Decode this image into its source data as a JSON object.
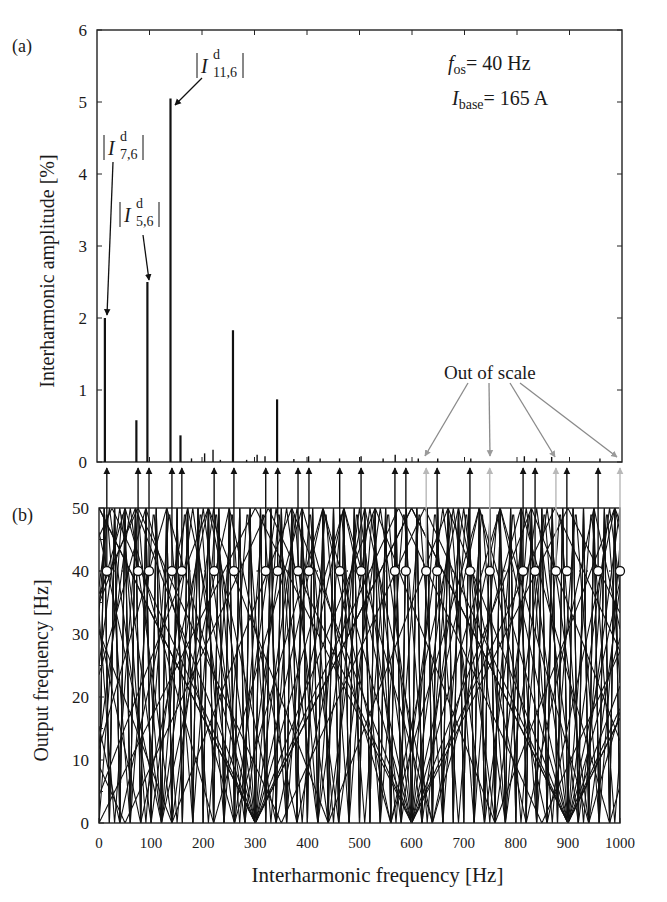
{
  "chart_data": [
    {
      "panel": "(a)",
      "type": "bar",
      "title": "",
      "xlabel": "",
      "ylabel": "Interharmonic amplitude [%]",
      "xlim": [
        0,
        1000
      ],
      "ylim": [
        0,
        6
      ],
      "yticks": [
        "0",
        "1",
        "2",
        "3",
        "4",
        "5",
        "6"
      ],
      "annotations": {
        "fos": "f",
        "fos_sub": "os",
        "fos_val": "= 40 Hz",
        "ibase": "I",
        "ibase_sub": "base",
        "ibase_val": "= 165 A",
        "out_of_scale": "Out of scale",
        "i11": {
          "I": "I",
          "sup": "d",
          "sub": "11,6"
        },
        "i7": {
          "I": "I",
          "sup": "d",
          "sub": "7,6"
        },
        "i5": {
          "I": "I",
          "sup": "d",
          "sub": "5,6"
        }
      },
      "x": [
        15,
        75,
        96,
        140,
        159,
        180,
        205,
        221,
        235,
        259,
        285,
        305,
        320,
        343,
        375,
        403,
        425,
        462,
        503,
        545,
        568,
        589,
        612,
        649,
        712,
        750,
        814,
        837,
        866,
        898,
        958
      ],
      "values": [
        2.0,
        0.58,
        2.5,
        5.05,
        0.37,
        0.05,
        0.12,
        0.17,
        0.03,
        1.83,
        0.03,
        0.1,
        0.08,
        0.87,
        0.04,
        0.08,
        0.05,
        0.05,
        0.08,
        0.05,
        0.1,
        0.05,
        0.05,
        0.05,
        0.05,
        0.0,
        0.08,
        0.05,
        0.07,
        0.0,
        0.05
      ],
      "legend": []
    },
    {
      "panel": "(b)",
      "type": "line",
      "title": "",
      "xlabel": "Interharmonic frequency [Hz]",
      "ylabel": "Output frequency [Hz]",
      "xlim": [
        0,
        1000
      ],
      "ylim": [
        0,
        50
      ],
      "xticks": [
        "0",
        "100",
        "200",
        "300",
        "400",
        "500",
        "600",
        "700",
        "800",
        "900",
        "1000"
      ],
      "yticks": [
        "0",
        "10",
        "20",
        "30",
        "40",
        "50"
      ],
      "dotted_line_at": 40,
      "vertex_points_hz": [
        300,
        600,
        900
      ],
      "fan_slopes_note": "interharmonic lines f = |k*fo - 6m*fi| folded at 50 Hz",
      "marked_intersections_40Hz": [
        15,
        75,
        96,
        140,
        159,
        221,
        259,
        320,
        343,
        382,
        403,
        462,
        503,
        568,
        589,
        628,
        649,
        712,
        750,
        814,
        837,
        877,
        898,
        958,
        1000
      ],
      "out_of_scale_hz": [
        628,
        750,
        877,
        1000
      ],
      "legend": []
    }
  ],
  "labels": {
    "panel_a": "(a)",
    "panel_b": "(b)",
    "ylabel_a": "Interharmonic amplitude [%]",
    "ylabel_b": "Output frequency [Hz]",
    "xlabel_b": "Interharmonic frequency [Hz]"
  }
}
